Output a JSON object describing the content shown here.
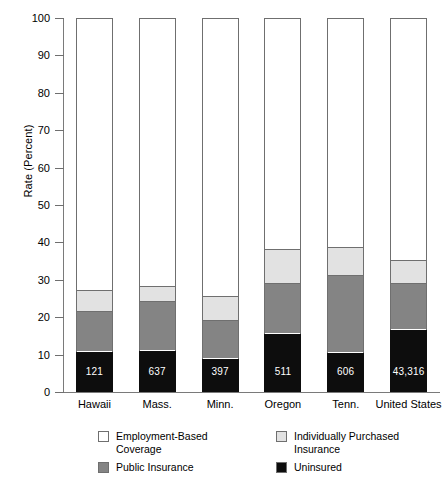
{
  "chart_data": {
    "type": "bar",
    "subtype": "stacked-bar",
    "title": "",
    "xlabel": "",
    "ylabel": "Rate (Percent)",
    "ylim": [
      0,
      100
    ],
    "yticks": [
      0,
      10,
      20,
      30,
      40,
      50,
      60,
      70,
      80,
      90,
      100
    ],
    "ytick_labels": [
      "0",
      "10",
      "20",
      "30",
      "40",
      "50",
      "60",
      "70",
      "80",
      "90",
      "100"
    ],
    "grid": false,
    "legend_position": "bottom",
    "categories": [
      "Hawaii",
      "Mass.",
      "Minn.",
      "Oregon",
      "Tenn.",
      "United States"
    ],
    "series": [
      {
        "name": "Uninsured",
        "color": "#0d0d0d",
        "values": [
          10.6,
          11.1,
          8.8,
          15.5,
          10.5,
          16.5
        ]
      },
      {
        "name": "Public Insurance",
        "color": "#848484",
        "values": [
          10.9,
          12.9,
          10.2,
          13.5,
          20.5,
          12.5
        ]
      },
      {
        "name": "Individually Purchased Insurance",
        "color": "#e2e2e2",
        "values": [
          5.4,
          4.2,
          6.5,
          9.0,
          7.5,
          6.0
        ]
      },
      {
        "name": "Employment-Based Coverage",
        "color": "#ffffff",
        "values": [
          73.1,
          71.8,
          74.5,
          62.0,
          61.5,
          65.0
        ]
      }
    ],
    "cumulative_tops": {
      "uninsured": [
        10.6,
        11.1,
        8.8,
        15.5,
        10.5,
        16.5
      ],
      "public": [
        21.5,
        24.0,
        19.0,
        29.0,
        31.0,
        29.0
      ],
      "individual": [
        26.9,
        28.2,
        25.5,
        38.0,
        38.5,
        35.0
      ],
      "employment": [
        100,
        100,
        100,
        100,
        100,
        100
      ]
    },
    "bar_value_labels": [
      "121",
      "637",
      "397",
      "511",
      "606",
      "43,316"
    ]
  },
  "legend": {
    "items": [
      {
        "label": "Employment-Based\nCoverage",
        "swatch": "#ffffff",
        "name": "legend-employment-based-coverage"
      },
      {
        "label": "Individually Purchased\nInsurance",
        "swatch": "#e2e2e2",
        "name": "legend-individually-purchased-insurance"
      },
      {
        "label": "Public Insurance",
        "swatch": "#848484",
        "name": "legend-public-insurance"
      },
      {
        "label": "Uninsured",
        "swatch": "#0d0d0d",
        "name": "legend-uninsured"
      }
    ]
  },
  "axis": {
    "y_title": "Rate (Percent)"
  }
}
